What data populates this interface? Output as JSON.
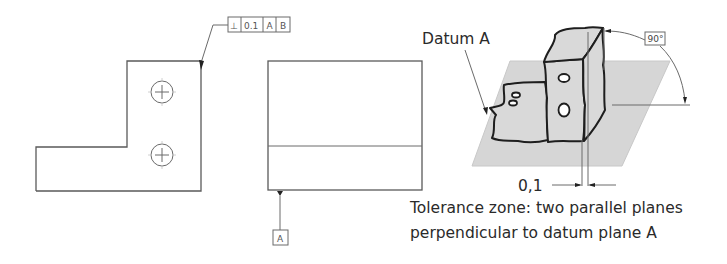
{
  "feature_control_frame": {
    "symbol": "⊥",
    "symbol_name": "perpendicularity",
    "tolerance": "0.1",
    "datum_primary": "A",
    "datum_secondary": "B"
  },
  "datum_feature": {
    "label": "A"
  },
  "pictorial": {
    "datum_label": "Datum A",
    "angle_label": "90°",
    "zone_width": "0,1",
    "caption_line1": "Tolerance zone: two parallel planes",
    "caption_line2": "perpendicular to datum plane A"
  },
  "colors": {
    "outline": "#5a5a5a",
    "part_fill": "#d9d9d9",
    "plane_fill": "#d6d6d6",
    "text": "#2a2a2a"
  }
}
